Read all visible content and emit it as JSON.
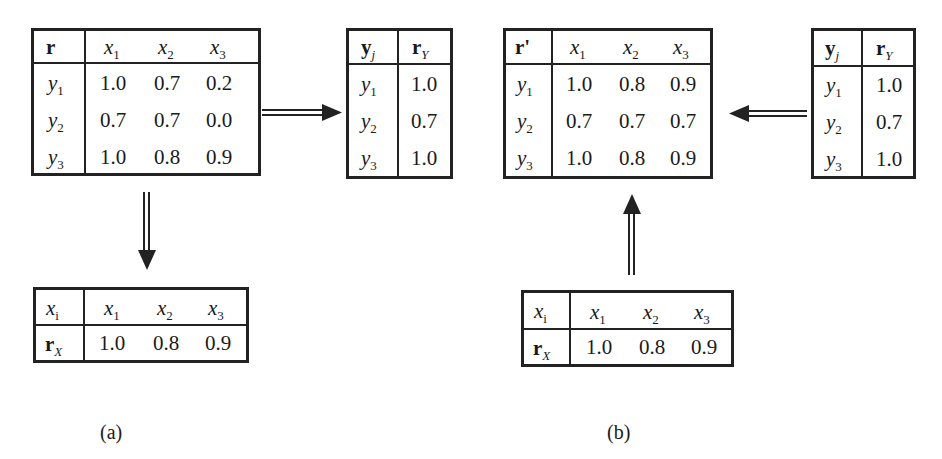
{
  "panels": {
    "a": {
      "label": "(a)",
      "relation_table": {
        "corner": "r",
        "col_headers": [
          {
            "base": "x",
            "sub": "1"
          },
          {
            "base": "x",
            "sub": "2"
          },
          {
            "base": "x",
            "sub": "3"
          }
        ],
        "rows": [
          {
            "head": {
              "base": "y",
              "sub": "1"
            },
            "values": [
              "1.0",
              "0.7",
              "0.2"
            ]
          },
          {
            "head": {
              "base": "y",
              "sub": "2"
            },
            "values": [
              "0.7",
              "0.7",
              "0.0"
            ]
          },
          {
            "head": {
              "base": "y",
              "sub": "3"
            },
            "values": [
              "1.0",
              "0.8",
              "0.9"
            ]
          }
        ]
      },
      "ry_table": {
        "header_left": {
          "base": "y",
          "sub": "j"
        },
        "header_right": {
          "base": "r",
          "sub": "Y"
        },
        "rows": [
          {
            "head": {
              "base": "y",
              "sub": "1"
            },
            "value": "1.0"
          },
          {
            "head": {
              "base": "y",
              "sub": "2"
            },
            "value": "0.7"
          },
          {
            "head": {
              "base": "y",
              "sub": "3"
            },
            "value": "1.0"
          }
        ]
      },
      "rx_table": {
        "corner": {
          "base": "x",
          "sub": "i"
        },
        "col_headers": [
          {
            "base": "x",
            "sub": "1"
          },
          {
            "base": "x",
            "sub": "2"
          },
          {
            "base": "x",
            "sub": "3"
          }
        ],
        "row_head": {
          "base": "r",
          "sub": "X"
        },
        "values": [
          "1.0",
          "0.8",
          "0.9"
        ]
      }
    },
    "b": {
      "label": "(b)",
      "relation_table": {
        "corner": "r'",
        "col_headers": [
          {
            "base": "x",
            "sub": "1"
          },
          {
            "base": "x",
            "sub": "2"
          },
          {
            "base": "x",
            "sub": "3"
          }
        ],
        "rows": [
          {
            "head": {
              "base": "y",
              "sub": "1"
            },
            "values": [
              "1.0",
              "0.8",
              "0.9"
            ]
          },
          {
            "head": {
              "base": "y",
              "sub": "2"
            },
            "values": [
              "0.7",
              "0.7",
              "0.7"
            ]
          },
          {
            "head": {
              "base": "y",
              "sub": "3"
            },
            "values": [
              "1.0",
              "0.8",
              "0.9"
            ]
          }
        ]
      },
      "ry_table": {
        "header_left": {
          "base": "y",
          "sub": "j"
        },
        "header_right": {
          "base": "r",
          "sub": "Y"
        },
        "rows": [
          {
            "head": {
              "base": "y",
              "sub": "1"
            },
            "value": "1.0"
          },
          {
            "head": {
              "base": "y",
              "sub": "2"
            },
            "value": "0.7"
          },
          {
            "head": {
              "base": "y",
              "sub": "3"
            },
            "value": "1.0"
          }
        ]
      },
      "rx_table": {
        "corner": {
          "base": "x",
          "sub": "i"
        },
        "col_headers": [
          {
            "base": "x",
            "sub": "1"
          },
          {
            "base": "x",
            "sub": "2"
          },
          {
            "base": "x",
            "sub": "3"
          }
        ],
        "row_head": {
          "base": "r",
          "sub": "X"
        },
        "values": [
          "1.0",
          "0.8",
          "0.9"
        ]
      }
    }
  },
  "arrows": [
    {
      "name": "a-relation-to-ry",
      "direction": "right",
      "style": "double-line"
    },
    {
      "name": "a-relation-to-rx",
      "direction": "down",
      "style": "double-line"
    },
    {
      "name": "b-ry-to-relation",
      "direction": "left",
      "style": "double-line"
    },
    {
      "name": "b-rx-to-relation",
      "direction": "up",
      "style": "double-line"
    }
  ],
  "colors": {
    "ink": "#222222",
    "background": "#ffffff"
  }
}
